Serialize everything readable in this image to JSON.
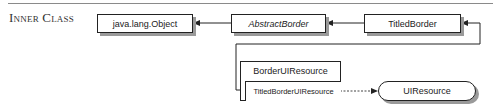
{
  "section": {
    "label": "Inner Class"
  },
  "nodes": {
    "object": {
      "label": "java.lang.Object"
    },
    "abstract_border": {
      "label": "AbstractBorder"
    },
    "titled_border": {
      "label": "TitledBorder"
    },
    "border_ui_resource": {
      "label": "BorderUIResource"
    },
    "titled_border_ui_resource": {
      "label": "TitledBorderUIResource"
    },
    "ui_resource": {
      "label": "UIResource"
    }
  },
  "edges": [
    {
      "from": "abstract_border",
      "to": "object",
      "style": "solid",
      "type": "extends"
    },
    {
      "from": "titled_border",
      "to": "abstract_border",
      "style": "solid",
      "type": "extends"
    },
    {
      "from": "titled_border_ui_resource",
      "to": "titled_border",
      "style": "solid",
      "type": "extends"
    },
    {
      "from": "titled_border_ui_resource",
      "to": "ui_resource",
      "style": "dashed",
      "type": "implements"
    }
  ],
  "colors": {
    "line": "#222222",
    "shadow": "#9a9a9a",
    "rule": "#8a8a8a"
  }
}
